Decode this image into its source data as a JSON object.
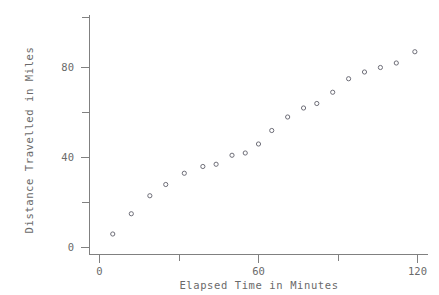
{
  "chart_data": {
    "type": "scatter",
    "title": "",
    "xlabel": "Elapsed Time in Minutes",
    "ylabel": "Distance Travelled in Miles",
    "xlim": [
      -2,
      122
    ],
    "ylim": [
      -2,
      92
    ],
    "grid": false,
    "legend": null,
    "x_ticks_major": [
      0,
      60,
      120
    ],
    "x_ticks_major_labels": [
      "0",
      "60",
      "120"
    ],
    "x_ticks_minor": [
      30,
      90
    ],
    "y_ticks_major": [
      0,
      40,
      80
    ],
    "y_ticks_major_labels": [
      "0",
      "40",
      "80"
    ],
    "y_ticks_minor": [
      20,
      60,
      100
    ],
    "marker": "open-circle",
    "marker_color": "#6e6e78",
    "axis_color": "#808080",
    "text_color": "#6a6a6a",
    "background": "#ffffff",
    "x": [
      5,
      12,
      19,
      25,
      32,
      39,
      44,
      50,
      55,
      60,
      65,
      71,
      77,
      82,
      88,
      94,
      100,
      106,
      112,
      119
    ],
    "y": [
      6,
      15,
      23,
      28,
      33,
      36,
      37,
      41,
      42,
      46,
      52,
      58,
      62,
      64,
      69,
      75,
      78,
      80,
      82,
      87
    ],
    "points": [
      {
        "x": 5,
        "y": 6
      },
      {
        "x": 12,
        "y": 15
      },
      {
        "x": 19,
        "y": 23
      },
      {
        "x": 25,
        "y": 28
      },
      {
        "x": 32,
        "y": 33
      },
      {
        "x": 39,
        "y": 36
      },
      {
        "x": 44,
        "y": 37
      },
      {
        "x": 50,
        "y": 41
      },
      {
        "x": 55,
        "y": 42
      },
      {
        "x": 60,
        "y": 46
      },
      {
        "x": 65,
        "y": 52
      },
      {
        "x": 71,
        "y": 58
      },
      {
        "x": 77,
        "y": 62
      },
      {
        "x": 82,
        "y": 64
      },
      {
        "x": 88,
        "y": 69
      },
      {
        "x": 94,
        "y": 75
      },
      {
        "x": 100,
        "y": 78
      },
      {
        "x": 106,
        "y": 80
      },
      {
        "x": 112,
        "y": 82
      },
      {
        "x": 119,
        "y": 87
      }
    ]
  },
  "labels": {
    "x_axis_title": "Elapsed Time in Minutes",
    "y_axis_title": "Distance Travelled in Miles",
    "x_tick_0": "0",
    "x_tick_1": "60",
    "x_tick_2": "120",
    "y_tick_0": "0",
    "y_tick_1": "40",
    "y_tick_2": "80"
  }
}
